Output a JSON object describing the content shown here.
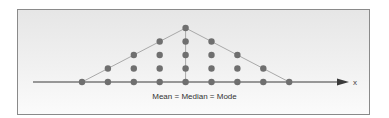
{
  "chart_data": {
    "type": "scatter",
    "subtype": "dot-plot",
    "title": "",
    "xlabel": "x",
    "ylabel": "",
    "annotation": "Mean = Median = Mode",
    "categories": [
      1,
      2,
      3,
      4,
      5,
      6,
      7,
      8,
      9
    ],
    "values": [
      1,
      2,
      3,
      4,
      5,
      4,
      3,
      2,
      1
    ],
    "outline": "symmetric triangle through column tops",
    "center_line": true,
    "grid": false,
    "legend": null
  },
  "colors": {
    "dot": "#6f6f6f",
    "outline": "#a9a9a9",
    "axis": "#3a3a3a",
    "frame": "#8a8a8a"
  }
}
